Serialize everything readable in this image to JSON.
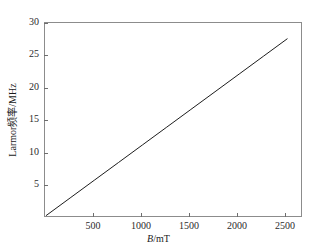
{
  "chart_data": {
    "type": "line",
    "title": "",
    "subtitle": "",
    "xlabel": "B/mT",
    "xlabel_symbol": "B",
    "xlabel_unit": "/mT",
    "ylabel": "Larmor频率/MHz",
    "xlim": [
      -10,
      2640
    ],
    "ylim": [
      0.35,
      30
    ],
    "xticks": [
      500,
      1000,
      1500,
      2000,
      2500
    ],
    "xticklabels": [
      "500",
      "1000",
      "1500",
      "2000",
      "2500"
    ],
    "yticks": [
      5,
      10,
      15,
      20,
      25,
      30
    ],
    "yticklabels": [
      "5",
      "10",
      "15",
      "20",
      "25",
      "30"
    ],
    "grid": false,
    "legend": false,
    "legend_position": "none",
    "series": [
      {
        "name": "Larmor frequency",
        "color": "#1a1a1a",
        "linewidth": 1,
        "x": [
          0,
          250,
          500,
          750,
          1000,
          1250,
          1500,
          1750,
          2000,
          2250,
          2500
        ],
        "values": [
          0.4,
          3.12,
          5.84,
          8.56,
          11.28,
          14.0,
          16.72,
          19.44,
          22.16,
          24.88,
          27.6
        ]
      }
    ],
    "annotations": []
  },
  "figure": {
    "background_color": "#ffffff",
    "frame_color": "#8c8c8c",
    "tick_color": "#6e6e6e",
    "text_color": "#1a1a1a"
  }
}
